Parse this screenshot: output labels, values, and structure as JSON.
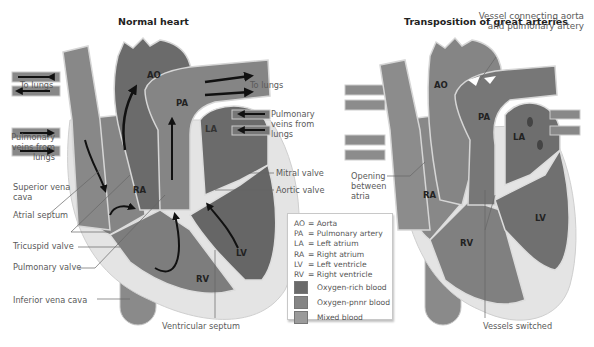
{
  "panels": [
    {
      "title": "Normal heart",
      "chambers": [
        "AO",
        "PA",
        "LA",
        "RA",
        "LV",
        "RV"
      ],
      "labels": {
        "to_lungs_left": "To lungs",
        "to_lungs_right": "To lungs",
        "pulm_veins_left": [
          "Pulmonary",
          "veins from",
          "lungs"
        ],
        "pulm_veins_right": [
          "Pulmonary",
          "veins from",
          "lungs"
        ],
        "superior_vena_cava": [
          "Superior vena",
          "cava"
        ],
        "atrial_septum": "Atrial septum",
        "tricuspid_valve": "Tricuspid valve",
        "pulmonary_valve": "Pulmonary valve",
        "inferior_vena_cava": "Inferior vena cava",
        "mitral_valve": "Mitral valve",
        "aortic_valve": "Aortic valve",
        "ventricular_septum": "Ventricular septum"
      }
    },
    {
      "title": "Transposition of great arteries",
      "chambers": [
        "AO",
        "PA",
        "LA",
        "RA",
        "LV",
        "RV"
      ],
      "labels": {
        "vessel_connecting": [
          "Vessel connecting aorta",
          "and pulmonary artery"
        ],
        "opening_between_atria": [
          "Opening",
          "between",
          "atria"
        ],
        "vessels_switched": "Vessels switched"
      }
    }
  ],
  "legend": {
    "abbreviations": [
      {
        "abbr": "AO",
        "text": "= Aorta"
      },
      {
        "abbr": "PA",
        "text": "= Pulmonary artery"
      },
      {
        "abbr": "LA",
        "text": "= Left atrium"
      },
      {
        "abbr": "RA",
        "text": "= Right atrium"
      },
      {
        "abbr": "LV",
        "text": "= Left ventricle"
      },
      {
        "abbr": "RV",
        "text": "= Right ventricle"
      }
    ],
    "swatches": [
      {
        "label": "Oxygen-rich blood",
        "color": "#6a6a6a"
      },
      {
        "label": "Oxygen-pnnr blood",
        "color": "#858585"
      },
      {
        "label": "Mixed blood",
        "color": "#9b9b9b"
      }
    ]
  },
  "colors": {
    "oxygen_rich": "#6a6a6a",
    "oxygen_poor": "#858585",
    "mixed": "#9b9b9b",
    "muscle": "#e2e2e2",
    "outline": "#d9d9d9"
  }
}
